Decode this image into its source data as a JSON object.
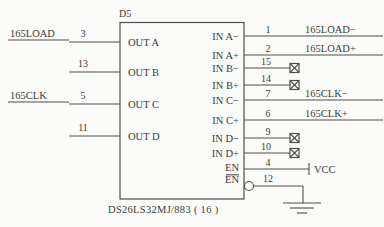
{
  "colors": {
    "line": "#4f4e4a",
    "text": "#3c3b38",
    "background": "#fbfbf9"
  },
  "schematic": {
    "designator": "D5",
    "part_number": "DS26LS32MJ/883 ( 16 )",
    "left_pins": [
      {
        "name": "OUT A",
        "pin": "3",
        "signal": "165LOAD"
      },
      {
        "name": "OUT B",
        "pin": "13",
        "signal": ""
      },
      {
        "name": "OUT C",
        "pin": "5",
        "signal": "165CLK"
      },
      {
        "name": "OUT D",
        "pin": "11",
        "signal": ""
      }
    ],
    "right_pins": [
      {
        "name": "IN A−",
        "pin": "1",
        "signal": "165LOAD−",
        "termination": "net"
      },
      {
        "name": "IN A+",
        "pin": "2",
        "signal": "165LOAD+",
        "termination": "net"
      },
      {
        "name": "IN B−",
        "pin": "15",
        "signal": "",
        "termination": "no-connect"
      },
      {
        "name": "IN B+",
        "pin": "14",
        "signal": "",
        "termination": "no-connect"
      },
      {
        "name": "IN C−",
        "pin": "7",
        "signal": "165CLK−",
        "termination": "net"
      },
      {
        "name": "IN C+",
        "pin": "6",
        "signal": "165CLK+",
        "termination": "net"
      },
      {
        "name": "IN D−",
        "pin": "9",
        "signal": "",
        "termination": "no-connect"
      },
      {
        "name": "IN D+",
        "pin": "10",
        "signal": "",
        "termination": "no-connect"
      },
      {
        "name": "EN",
        "pin": "4",
        "signal": "VCC",
        "termination": "vcc"
      },
      {
        "name": "EN",
        "pin": "12",
        "signal": "",
        "termination": "ground",
        "overline": true,
        "bubble": true
      }
    ]
  }
}
